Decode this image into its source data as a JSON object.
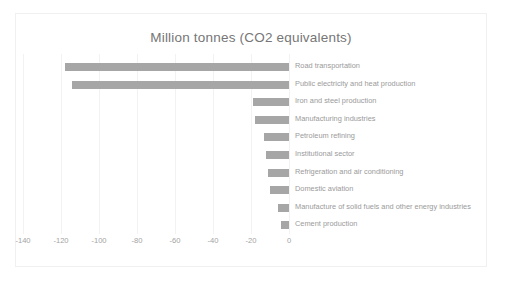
{
  "chart_data": {
    "type": "bar",
    "orientation": "horizontal",
    "title": "Million tonnes (CO2 equivalents)",
    "xlabel": "",
    "ylabel": "",
    "xlim": [
      -140,
      0
    ],
    "grid": true,
    "legend": "none",
    "xticks": [
      "-140",
      "-120",
      "-100",
      "-80",
      "-60",
      "-40",
      "-20",
      "0"
    ],
    "xtick_values": [
      -140,
      -120,
      -100,
      -80,
      -60,
      -40,
      -20,
      0
    ],
    "categories": [
      "Road transportation",
      "Public electricity and heat production",
      "Iron and steel production",
      "Manufacturing industries",
      "Petroleum refining",
      "Institutional sector",
      "Refrigeration and air conditioning",
      "Domestic aviation",
      "Manufacture of solid fuels and other energy industries",
      "Cement production"
    ],
    "values": [
      -118,
      -114,
      -19,
      -18,
      -13,
      -12,
      -11,
      -10,
      -6,
      -4
    ],
    "bar_color": "#a6a6a6",
    "grid_color": "#f2f2f2",
    "text_color": "#9a9a9a",
    "title_color": "#767676"
  }
}
